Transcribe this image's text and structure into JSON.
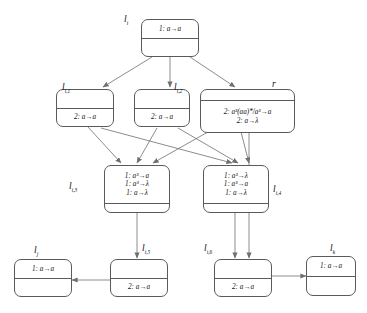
{
  "diagram": {
    "type": "flow-graph",
    "title": "",
    "nodes": [
      {
        "id": "li",
        "tag": "l",
        "tag_sub": "i",
        "top_text": "1: a→a",
        "bottom_text": "",
        "text_cell": "top",
        "lines": [
          "1: a→a"
        ]
      },
      {
        "id": "li1",
        "tag": "l",
        "tag_sub": "i,1",
        "top_text": "",
        "bottom_text": "2: a→a",
        "text_cell": "bottom",
        "lines": [
          "2: a→a"
        ]
      },
      {
        "id": "li2",
        "tag": "l",
        "tag_sub": "i,2",
        "top_text": "",
        "bottom_text": "2: a→a",
        "text_cell": "bottom",
        "lines": [
          "2: a→a"
        ]
      },
      {
        "id": "r",
        "tag": "r",
        "tag_sub": "",
        "top_text": "",
        "bottom_text": "2: a3(aa)*/a3→a | 2: a→λ",
        "text_cell": "bottom",
        "lines": [
          "2: a³(aa)*/a³→a",
          "2: a→λ"
        ]
      },
      {
        "id": "li3",
        "tag": "l",
        "tag_sub": "i,3",
        "top_text": "1: a3→a | 1: a3→λ | 1: a→λ",
        "bottom_text": "",
        "text_cell": "top",
        "lines": [
          "1: a³→a",
          "1: a³→λ",
          "1: a→λ"
        ]
      },
      {
        "id": "li4",
        "tag": "l",
        "tag_sub": "i,4",
        "top_text": "1: a3→λ | 1: a3→a | 1: a→λ",
        "bottom_text": "",
        "text_cell": "top",
        "lines": [
          "1: a³→λ",
          "1: a³→a",
          "1: a→λ"
        ]
      },
      {
        "id": "lj",
        "tag": "l",
        "tag_sub": "j",
        "top_text": "1: a→a",
        "bottom_text": "",
        "text_cell": "top",
        "lines": [
          "1: a→a"
        ]
      },
      {
        "id": "li5",
        "tag": "l",
        "tag_sub": "i,5",
        "top_text": "",
        "bottom_text": "2: a→a",
        "text_cell": "bottom",
        "lines": [
          "2: a→a"
        ]
      },
      {
        "id": "li6",
        "tag": "l",
        "tag_sub": "i,6",
        "top_text": "",
        "bottom_text": "2: a→a",
        "text_cell": "bottom",
        "lines": [
          "2: a→a"
        ]
      },
      {
        "id": "lk",
        "tag": "l",
        "tag_sub": "k",
        "top_text": "1: a→a",
        "bottom_text": "",
        "text_cell": "top",
        "lines": [
          "1: a→a"
        ]
      }
    ],
    "edges": [
      {
        "from": "li",
        "to": "li1"
      },
      {
        "from": "li",
        "to": "li2"
      },
      {
        "from": "li",
        "to": "r"
      },
      {
        "from": "li1",
        "to": "li3"
      },
      {
        "from": "li1",
        "to": "li4"
      },
      {
        "from": "li2",
        "to": "li3"
      },
      {
        "from": "li2",
        "to": "li4"
      },
      {
        "from": "r",
        "to": "li3"
      },
      {
        "from": "r",
        "to": "li4"
      },
      {
        "from": "r",
        "to": "li6"
      },
      {
        "from": "li3",
        "to": "li5"
      },
      {
        "from": "li4",
        "to": "li6"
      },
      {
        "from": "li5",
        "to": "lj"
      },
      {
        "from": "li6",
        "to": "lk"
      }
    ],
    "colors": {
      "stroke": "#5a5a5a",
      "edge": "#6e6e6e",
      "text": "#111111",
      "background": "#ffffff"
    }
  }
}
